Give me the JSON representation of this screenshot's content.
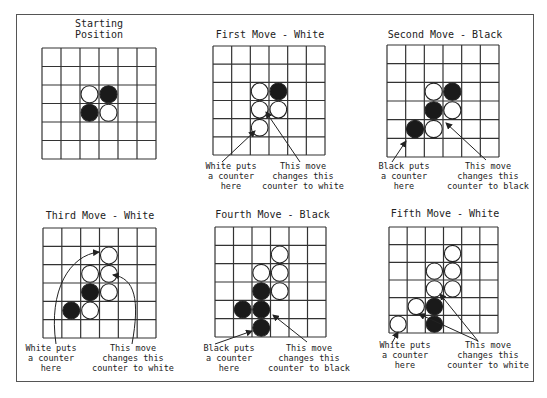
{
  "diagram": {
    "grid_size": 6,
    "colors": {
      "line": "#333333",
      "black": "#1a1a1a",
      "white": "#ffffff",
      "frame": "#555555"
    },
    "panels": [
      {
        "id": "starting-position",
        "title": "Starting\nPosition",
        "grid": {
          "x": 42,
          "y": 48,
          "w": 114,
          "h": 111
        },
        "title_pos": {
          "x": 42,
          "y": 18,
          "w": 114
        },
        "counters": [
          {
            "row": 2,
            "col": 2,
            "color": "white"
          },
          {
            "row": 2,
            "col": 3,
            "color": "black"
          },
          {
            "row": 3,
            "col": 2,
            "color": "black"
          },
          {
            "row": 3,
            "col": 3,
            "color": "white"
          }
        ],
        "labels": [],
        "arrows": []
      },
      {
        "id": "first-move",
        "title": "First Move - White",
        "grid": {
          "x": 213,
          "y": 46,
          "w": 112,
          "h": 109
        },
        "title_pos": {
          "x": 200,
          "y": 29,
          "w": 140
        },
        "counters": [
          {
            "row": 2,
            "col": 2,
            "color": "white"
          },
          {
            "row": 2,
            "col": 3,
            "color": "black"
          },
          {
            "row": 3,
            "col": 2,
            "color": "white"
          },
          {
            "row": 3,
            "col": 3,
            "color": "white"
          },
          {
            "row": 4,
            "col": 2,
            "color": "white"
          }
        ],
        "labels": [
          {
            "text": "White puts\na counter\nhere",
            "x": 198,
            "y": 161,
            "w": 66
          },
          {
            "text": "This move\nchanges this\ncounter to white",
            "x": 258,
            "y": 161,
            "w": 90
          }
        ],
        "arrows": [
          {
            "d": "M 222 162 L 255 131",
            "head": [
              255,
              131
            ]
          },
          {
            "d": "M 300 162 L 266 112",
            "head": [
              266,
              112
            ]
          }
        ]
      },
      {
        "id": "second-move",
        "title": "Second Move - Black",
        "grid": {
          "x": 387,
          "y": 45,
          "w": 112,
          "h": 112
        },
        "title_pos": {
          "x": 375,
          "y": 29,
          "w": 140
        },
        "counters": [
          {
            "row": 2,
            "col": 2,
            "color": "white"
          },
          {
            "row": 2,
            "col": 3,
            "color": "black"
          },
          {
            "row": 3,
            "col": 2,
            "color": "black"
          },
          {
            "row": 3,
            "col": 3,
            "color": "white"
          },
          {
            "row": 4,
            "col": 1,
            "color": "black"
          },
          {
            "row": 4,
            "col": 2,
            "color": "white"
          }
        ],
        "labels": [
          {
            "text": "Black puts\na counter\nhere",
            "x": 371,
            "y": 161,
            "w": 66
          },
          {
            "text": "This move\nchanges this\ncounter to black",
            "x": 443,
            "y": 161,
            "w": 90
          }
        ],
        "arrows": [
          {
            "d": "M 392 162 L 406 141",
            "head": [
              406,
              141
            ]
          },
          {
            "d": "M 486 160 L 446 123",
            "head": [
              446,
              123
            ]
          }
        ]
      },
      {
        "id": "third-move",
        "title": "Third Move - White",
        "grid": {
          "x": 43,
          "y": 228,
          "w": 113,
          "h": 110
        },
        "title_pos": {
          "x": 30,
          "y": 210,
          "w": 140
        },
        "counters": [
          {
            "row": 1,
            "col": 3,
            "color": "white"
          },
          {
            "row": 2,
            "col": 2,
            "color": "white"
          },
          {
            "row": 2,
            "col": 3,
            "color": "white"
          },
          {
            "row": 3,
            "col": 2,
            "color": "black"
          },
          {
            "row": 3,
            "col": 3,
            "color": "white"
          },
          {
            "row": 4,
            "col": 1,
            "color": "black"
          },
          {
            "row": 4,
            "col": 2,
            "color": "white"
          }
        ],
        "labels": [
          {
            "text": "White puts\na counter\nhere",
            "x": 18,
            "y": 343,
            "w": 66
          },
          {
            "text": "This move\nchanges this\ncounter to white",
            "x": 88,
            "y": 343,
            "w": 90
          }
        ],
        "arrows": [
          {
            "d": "M 56 344 C 48 290 70 255 99 252",
            "head": [
              99,
              252
            ]
          },
          {
            "d": "M 132 344 C 140 300 135 278 113 275",
            "head": [
              113,
              275
            ]
          }
        ]
      },
      {
        "id": "fourth-move",
        "title": "Fourth Move - Black",
        "grid": {
          "x": 215,
          "y": 227,
          "w": 111,
          "h": 110
        },
        "title_pos": {
          "x": 200,
          "y": 209,
          "w": 145
        },
        "counters": [
          {
            "row": 1,
            "col": 3,
            "color": "white"
          },
          {
            "row": 2,
            "col": 2,
            "color": "white"
          },
          {
            "row": 2,
            "col": 3,
            "color": "white"
          },
          {
            "row": 3,
            "col": 2,
            "color": "black"
          },
          {
            "row": 3,
            "col": 3,
            "color": "white"
          },
          {
            "row": 4,
            "col": 1,
            "color": "black"
          },
          {
            "row": 4,
            "col": 2,
            "color": "black"
          },
          {
            "row": 5,
            "col": 2,
            "color": "black"
          }
        ],
        "labels": [
          {
            "text": "Black puts\na counter\nhere",
            "x": 196,
            "y": 343,
            "w": 66
          },
          {
            "text": "This move\nchanges this\ncounter to black",
            "x": 264,
            "y": 343,
            "w": 90
          }
        ],
        "arrows": [
          {
            "d": "M 215 344 L 252 331",
            "head": [
              252,
              331
            ]
          },
          {
            "d": "M 307 342 L 273 315",
            "head": [
              273,
              315
            ]
          }
        ]
      },
      {
        "id": "fifth-move",
        "title": "Fifth Move - White",
        "grid": {
          "x": 389,
          "y": 227,
          "w": 109,
          "h": 106
        },
        "title_pos": {
          "x": 375,
          "y": 208,
          "w": 140
        },
        "counters": [
          {
            "row": 1,
            "col": 3,
            "color": "white"
          },
          {
            "row": 2,
            "col": 2,
            "color": "white"
          },
          {
            "row": 2,
            "col": 3,
            "color": "white"
          },
          {
            "row": 3,
            "col": 2,
            "color": "white"
          },
          {
            "row": 3,
            "col": 3,
            "color": "white"
          },
          {
            "row": 4,
            "col": 1,
            "color": "white"
          },
          {
            "row": 4,
            "col": 2,
            "color": "black"
          },
          {
            "row": 5,
            "col": 0,
            "color": "white"
          },
          {
            "row": 5,
            "col": 2,
            "color": "black"
          }
        ],
        "labels": [
          {
            "text": "White puts\na counter\nhere",
            "x": 372,
            "y": 340,
            "w": 66
          },
          {
            "text": "This move\nchanges this\ncounter to white",
            "x": 443,
            "y": 340,
            "w": 90
          }
        ],
        "arrows": [
          {
            "d": "M 392 343 L 398 332",
            "head": [
              398,
              332
            ]
          },
          {
            "d": "M 478 341 L 440 294",
            "head": [
              440,
              294
            ]
          },
          {
            "d": "M 478 341 L 419 314",
            "head": [
              419,
              314
            ]
          }
        ]
      }
    ]
  }
}
